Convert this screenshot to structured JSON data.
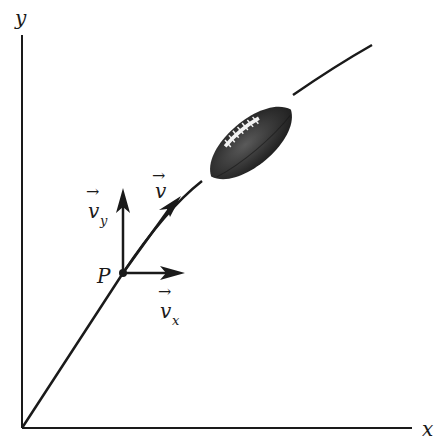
{
  "diagram": {
    "axes": {
      "x_label": "x",
      "y_label": "y"
    },
    "point": {
      "label": "P"
    },
    "vectors": {
      "v": {
        "label": "v",
        "arrow": "→"
      },
      "vx": {
        "label": "v",
        "subscript": "x",
        "arrow": "→"
      },
      "vy": {
        "label": "v",
        "subscript": "y",
        "arrow": "→"
      }
    },
    "object": "football",
    "colors": {
      "ink": "#1a1a1a",
      "ball_dark": "#2b2b2b",
      "ball_mid": "#555555",
      "laces": "#f2f2f2",
      "background": "#ffffff"
    }
  }
}
